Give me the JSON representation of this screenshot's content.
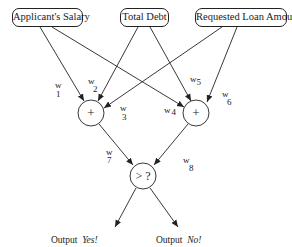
{
  "inputs": {
    "salary": "Applicant's Salary",
    "debt": "Total Debt",
    "loan": "Requested Loan Amount"
  },
  "weights": {
    "w1": {
      "letter": "w",
      "sub": "1"
    },
    "w2": {
      "letter": "w",
      "sub": "2"
    },
    "w3": {
      "letter": "w",
      "sub": "3"
    },
    "w4": {
      "letter": "w",
      "sub": "4"
    },
    "w5": {
      "letter": "w",
      "sub": "5"
    },
    "w6": {
      "letter": "w",
      "sub": "6"
    },
    "w7": {
      "letter": "w",
      "sub": "7"
    },
    "w8": {
      "letter": "w",
      "sub": "8"
    }
  },
  "operators": {
    "sum_left": "+",
    "sum_right": "+",
    "compare": "> ?"
  },
  "outputs": {
    "yes_prefix": "Output",
    "yes_value": "Yes!",
    "no_prefix": "Output",
    "no_value": "No!"
  },
  "colors": {
    "line": "#222222",
    "background": "#ffffff"
  }
}
